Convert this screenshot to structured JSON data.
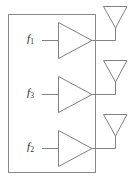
{
  "figure": {
    "type": "block-diagram",
    "background_color": "#ffffff",
    "line_color": "#808080",
    "label_color": "#2b2b2b"
  },
  "enclosure": {
    "name": "transmitter-enclosure",
    "x": 8,
    "y": 14,
    "width": 88,
    "height": 159
  },
  "channels": [
    {
      "id": "channel-1",
      "signal_symbol": "f",
      "signal_subscript": "1",
      "signal_label": "f1",
      "label_x": 27,
      "label_y": 34,
      "input_line": {
        "x1": 42,
        "y1": 40,
        "x2": 58,
        "y2": 40
      },
      "amplifier": {
        "x1": 58,
        "y1": 22,
        "x2": 58,
        "y2": 58,
        "apex_x": 92,
        "apex_y": 40
      },
      "output_line": {
        "x1": 92,
        "y1": 40,
        "x2": 115,
        "y2": 40
      },
      "antenna": {
        "left_x": 103,
        "right_x": 127,
        "top_y": 6,
        "apex_x": 115,
        "apex_y": 28,
        "stem_bottom_y": 40
      }
    },
    {
      "id": "channel-2",
      "signal_symbol": "f",
      "signal_subscript": "3",
      "signal_label": "f3",
      "label_x": 27,
      "label_y": 88,
      "input_line": {
        "x1": 42,
        "y1": 94,
        "x2": 58,
        "y2": 94
      },
      "amplifier": {
        "x1": 58,
        "y1": 76,
        "x2": 58,
        "y2": 112,
        "apex_x": 92,
        "apex_y": 94
      },
      "output_line": {
        "x1": 92,
        "y1": 94,
        "x2": 115,
        "y2": 94
      },
      "antenna": {
        "left_x": 103,
        "right_x": 127,
        "top_y": 60,
        "apex_x": 115,
        "apex_y": 82,
        "stem_bottom_y": 94
      }
    },
    {
      "id": "channel-3",
      "signal_symbol": "f",
      "signal_subscript": "2",
      "signal_label": "f2",
      "label_x": 27,
      "label_y": 142,
      "input_line": {
        "x1": 42,
        "y1": 148,
        "x2": 58,
        "y2": 148
      },
      "amplifier": {
        "x1": 58,
        "y1": 130,
        "x2": 58,
        "y2": 166,
        "apex_x": 92,
        "apex_y": 148
      },
      "output_line": {
        "x1": 92,
        "y1": 148,
        "x2": 115,
        "y2": 148
      },
      "antenna": {
        "left_x": 103,
        "right_x": 127,
        "top_y": 114,
        "apex_x": 115,
        "apex_y": 136,
        "stem_bottom_y": 148
      }
    }
  ]
}
